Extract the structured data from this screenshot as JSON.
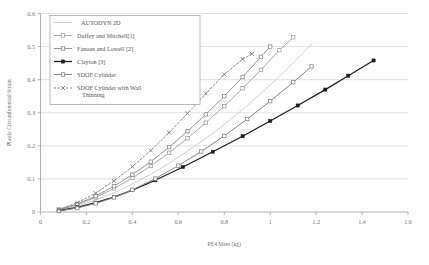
{
  "chart_data": {
    "type": "line",
    "title": "",
    "xlabel": "PE4 Mass (kg)",
    "ylabel": "Plastic Circumferential Strain",
    "xlim": [
      0,
      1.6
    ],
    "ylim": [
      0,
      0.6
    ],
    "xticks": [
      "0",
      "0.2",
      "0.4",
      "0.6",
      "0.8",
      "1",
      "1.2",
      "1.4",
      "1.6"
    ],
    "xtick_values": [
      0,
      0.2,
      0.4,
      0.6,
      0.8,
      1.0,
      1.2,
      1.4,
      1.6
    ],
    "yticks": [
      "0",
      "0.1",
      "0.2",
      "0.3",
      "0.4",
      "0.5",
      "0.6"
    ],
    "ytick_values": [
      0,
      0.1,
      0.2,
      0.3,
      0.4,
      0.5,
      0.6
    ],
    "grid": "horizontal",
    "legend_position": "top-left",
    "series": [
      {
        "name": "AUTODYN 2D",
        "color": "#c9c9c9",
        "marker": "none",
        "dash": "none",
        "width": 0.9,
        "x": [
          0.08,
          0.16,
          0.24,
          0.32,
          0.4,
          0.48,
          0.56,
          0.64,
          0.72,
          0.8,
          0.88,
          0.96,
          1.04,
          1.12,
          1.18
        ],
        "y": [
          0.005,
          0.018,
          0.036,
          0.058,
          0.085,
          0.114,
          0.147,
          0.184,
          0.223,
          0.265,
          0.31,
          0.358,
          0.41,
          0.465,
          0.508
        ]
      },
      {
        "name": "Duffey and Mitchell[1]",
        "color": "#9e9e9e",
        "marker": "square-open",
        "dash": "none",
        "width": 0.9,
        "x": [
          0.08,
          0.16,
          0.24,
          0.32,
          0.4,
          0.48,
          0.56,
          0.64,
          0.72,
          0.8,
          0.88,
          0.96,
          1.04,
          1.1
        ],
        "y": [
          0.006,
          0.022,
          0.044,
          0.071,
          0.103,
          0.139,
          0.179,
          0.223,
          0.27,
          0.32,
          0.374,
          0.43,
          0.489,
          0.528
        ]
      },
      {
        "name": "Fanous and Lowell [2]",
        "color": "#8a8a8a",
        "marker": "square-open",
        "dash": "none",
        "width": 0.9,
        "x": [
          0.08,
          0.16,
          0.24,
          0.32,
          0.4,
          0.48,
          0.56,
          0.64,
          0.72,
          0.8,
          0.88,
          0.96,
          1.0
        ],
        "y": [
          0.007,
          0.024,
          0.048,
          0.078,
          0.113,
          0.152,
          0.196,
          0.244,
          0.295,
          0.35,
          0.408,
          0.469,
          0.5
        ]
      },
      {
        "name": "Clayton [3]",
        "color": "#1c1c1c",
        "marker": "square-filled",
        "dash": "none",
        "width": 1.3,
        "x": [
          0.08,
          0.16,
          0.24,
          0.32,
          0.4,
          0.5,
          0.62,
          0.75,
          0.88,
          1.0,
          1.12,
          1.24,
          1.34,
          1.45
        ],
        "y": [
          0.004,
          0.014,
          0.028,
          0.045,
          0.066,
          0.096,
          0.136,
          0.182,
          0.229,
          0.275,
          0.322,
          0.37,
          0.412,
          0.458
        ]
      },
      {
        "name": "SDOF Cylinder",
        "color": "#868686",
        "marker": "square-open",
        "dash": "none",
        "width": 1.0,
        "x": [
          0.08,
          0.16,
          0.24,
          0.32,
          0.4,
          0.5,
          0.6,
          0.7,
          0.8,
          0.9,
          1.0,
          1.1,
          1.18
        ],
        "y": [
          0.003,
          0.012,
          0.026,
          0.044,
          0.067,
          0.101,
          0.14,
          0.183,
          0.23,
          0.281,
          0.335,
          0.392,
          0.44
        ]
      },
      {
        "name": "SDOF Cylinder with Wall Thinning",
        "color": "#7d7d7d",
        "marker": "cross",
        "dash": "2,2",
        "width": 0.9,
        "x": [
          0.08,
          0.16,
          0.24,
          0.32,
          0.4,
          0.48,
          0.56,
          0.64,
          0.72,
          0.8,
          0.88,
          0.92
        ],
        "y": [
          0.008,
          0.028,
          0.057,
          0.094,
          0.137,
          0.186,
          0.24,
          0.298,
          0.358,
          0.416,
          0.462,
          0.478
        ]
      }
    ]
  },
  "legend": {
    "items": [
      {
        "label": "AUTODYN 2D"
      },
      {
        "label": "Duffey and Mitchell[1]"
      },
      {
        "label": "Fanous and Lowell [2]"
      },
      {
        "label": "Clayton [3]"
      },
      {
        "label": "SDOF Cylinder"
      },
      {
        "label": "SDOF Cylinder with Wall"
      },
      {
        "label": "Thinning"
      }
    ]
  }
}
